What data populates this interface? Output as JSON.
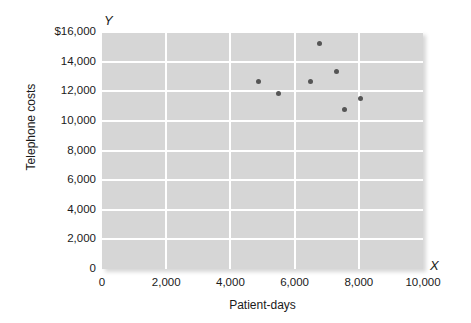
{
  "chart_data": {
    "type": "scatter",
    "title": "",
    "xlabel": "Patient-days",
    "ylabel": "Telephone costs",
    "x_axis_letter": "X",
    "y_axis_letter": "Y",
    "xlim": [
      0,
      10000
    ],
    "ylim": [
      0,
      16000
    ],
    "x_ticks": [
      0,
      2000,
      4000,
      6000,
      8000,
      10000
    ],
    "x_tick_labels": [
      "0",
      "2,000",
      "4,000",
      "6,000",
      "8,000",
      "10,000"
    ],
    "y_ticks": [
      0,
      2000,
      4000,
      6000,
      8000,
      10000,
      12000,
      14000,
      16000
    ],
    "y_tick_labels": [
      "0",
      "2,000",
      "4,000",
      "6,000",
      "8,000",
      "10,000",
      "12,000",
      "14,000",
      "$16,000"
    ],
    "grid": true,
    "grid_color": "#ffffff",
    "legend": null,
    "plot_background": "#d6d6d6",
    "marker_color": "#555555",
    "points": [
      {
        "x": 4860,
        "y": 12630
      },
      {
        "x": 5510,
        "y": 11880
      },
      {
        "x": 6510,
        "y": 12630
      },
      {
        "x": 6790,
        "y": 15190
      },
      {
        "x": 7320,
        "y": 13300
      },
      {
        "x": 7540,
        "y": 10740
      },
      {
        "x": 8040,
        "y": 11480
      }
    ]
  }
}
